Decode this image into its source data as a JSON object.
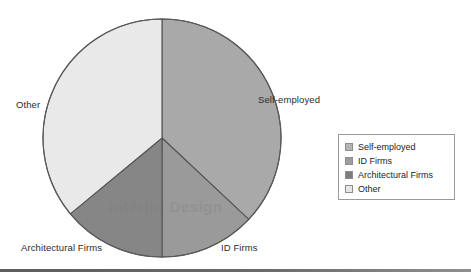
{
  "chart_data": {
    "type": "pie",
    "title": "",
    "subtitle": "",
    "xlabel": "",
    "ylabel": "",
    "grid": false,
    "legend_position": "right",
    "categories": [
      "Self-employed",
      "ID Firms",
      "Architectural Firms",
      "Other"
    ],
    "values": [
      37,
      13,
      14,
      36
    ],
    "units": "percent",
    "slices": [
      {
        "label": "Self-employed",
        "value": 37,
        "color": "#a9a9a9",
        "start_angle_deg": 0,
        "end_angle_deg": 133.2
      },
      {
        "label": "ID Firms",
        "value": 13,
        "color": "#9a9a9a",
        "start_angle_deg": 133.2,
        "end_angle_deg": 180.0
      },
      {
        "label": "Architectural Firms",
        "value": 14,
        "color": "#868686",
        "start_angle_deg": 180.0,
        "end_angle_deg": 230.4
      },
      {
        "label": "Other",
        "value": 36,
        "color": "#e9e9e9",
        "start_angle_deg": 230.4,
        "end_angle_deg": 360.0
      }
    ],
    "legend": [
      {
        "label": "Self-employed",
        "color": "#b4b4b4"
      },
      {
        "label": "ID Firms",
        "color": "#9d9d9d"
      },
      {
        "label": "Architectural Firms",
        "color": "#7e7e7e"
      },
      {
        "label": "Other",
        "color": "#e6e6e6"
      }
    ],
    "slice_labels": {
      "other": "Other",
      "self_employed": "Self-employed",
      "id_firms": "ID Firms",
      "architectural_firms": "Architectural Firms"
    }
  },
  "watermark": {
    "text": "Interior Design"
  },
  "style": {
    "pie_outline": "#555555",
    "legend_border": "#9a9a9a",
    "text_color": "#2b2b2b",
    "background": "#ffffff",
    "rule_color": "#6a6a6a"
  }
}
